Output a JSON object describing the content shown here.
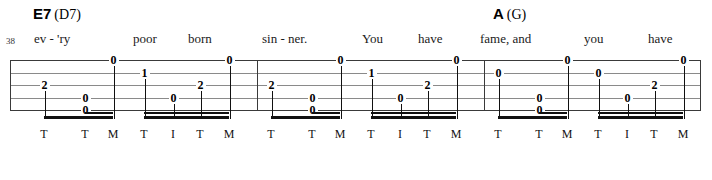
{
  "sheet": {
    "measure_number": "38",
    "chords": [
      {
        "root": "E7",
        "alt": "(D7)",
        "x": 33
      },
      {
        "root": "A",
        "alt": "(G)",
        "x": 493
      }
    ],
    "lyrics": [
      {
        "text": "ev - 'ry",
        "x": 34
      },
      {
        "text": "poor",
        "x": 133
      },
      {
        "text": "born",
        "x": 188
      },
      {
        "text": "sin - ner.",
        "x": 262
      },
      {
        "text": "You",
        "x": 362
      },
      {
        "text": "have",
        "x": 418
      },
      {
        "text": "fame, and",
        "x": 480
      },
      {
        "text": "you",
        "x": 584
      },
      {
        "text": "have",
        "x": 648
      }
    ],
    "staff": {
      "strings": 5,
      "left": 10,
      "right": 700,
      "top": 60,
      "line_spacing": 12.5,
      "barlines": [
        10,
        257,
        484,
        700
      ]
    },
    "notes": [
      {
        "x": 44,
        "string": 3,
        "fret": "2"
      },
      {
        "x": 113,
        "string": 1,
        "fret": "0"
      },
      {
        "x": 85,
        "string": 4,
        "fret": "0"
      },
      {
        "x": 85,
        "string": 5,
        "fret": "0"
      },
      {
        "x": 144,
        "string": 2,
        "fret": "1"
      },
      {
        "x": 173,
        "string": 4,
        "fret": "0"
      },
      {
        "x": 200,
        "string": 3,
        "fret": "2"
      },
      {
        "x": 229,
        "string": 1,
        "fret": "0"
      },
      {
        "x": 271,
        "string": 3,
        "fret": "2"
      },
      {
        "x": 340,
        "string": 1,
        "fret": "0"
      },
      {
        "x": 312,
        "string": 4,
        "fret": "0"
      },
      {
        "x": 312,
        "string": 5,
        "fret": "0"
      },
      {
        "x": 371,
        "string": 2,
        "fret": "1"
      },
      {
        "x": 400,
        "string": 4,
        "fret": "0"
      },
      {
        "x": 427,
        "string": 3,
        "fret": "2"
      },
      {
        "x": 456,
        "string": 1,
        "fret": "0"
      },
      {
        "x": 498,
        "string": 2,
        "fret": "0"
      },
      {
        "x": 567,
        "string": 1,
        "fret": "0"
      },
      {
        "x": 539,
        "string": 4,
        "fret": "0"
      },
      {
        "x": 539,
        "string": 5,
        "fret": "0"
      },
      {
        "x": 598,
        "string": 2,
        "fret": "0"
      },
      {
        "x": 627,
        "string": 4,
        "fret": "0"
      },
      {
        "x": 654,
        "string": 3,
        "fret": "2"
      },
      {
        "x": 683,
        "string": 1,
        "fret": "0"
      }
    ],
    "fingering": [
      {
        "label": "T",
        "x": 44
      },
      {
        "label": "T",
        "x": 85
      },
      {
        "label": "M",
        "x": 113
      },
      {
        "label": "T",
        "x": 144
      },
      {
        "label": "I",
        "x": 173
      },
      {
        "label": "T",
        "x": 200
      },
      {
        "label": "M",
        "x": 229
      },
      {
        "label": "T",
        "x": 271
      },
      {
        "label": "T",
        "x": 312
      },
      {
        "label": "M",
        "x": 340
      },
      {
        "label": "T",
        "x": 371
      },
      {
        "label": "I",
        "x": 400
      },
      {
        "label": "T",
        "x": 427
      },
      {
        "label": "M",
        "x": 456
      },
      {
        "label": "T",
        "x": 498
      },
      {
        "label": "T",
        "x": 539
      },
      {
        "label": "M",
        "x": 567
      },
      {
        "label": "T",
        "x": 598
      },
      {
        "label": "I",
        "x": 627
      },
      {
        "label": "T",
        "x": 654
      },
      {
        "label": "M",
        "x": 683
      }
    ],
    "beams": [
      {
        "x": 44,
        "w": 69,
        "double": false
      },
      {
        "x": 85,
        "w": 28,
        "double": true
      },
      {
        "x": 144,
        "w": 85,
        "double": true
      },
      {
        "x": 271,
        "w": 69,
        "double": false
      },
      {
        "x": 312,
        "w": 28,
        "double": true
      },
      {
        "x": 371,
        "w": 85,
        "double": true
      },
      {
        "x": 498,
        "w": 69,
        "double": false
      },
      {
        "x": 539,
        "w": 28,
        "double": true
      },
      {
        "x": 598,
        "w": 85,
        "double": true
      }
    ]
  }
}
